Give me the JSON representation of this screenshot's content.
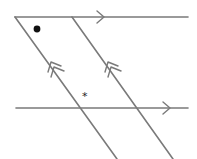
{
  "diagram": {
    "type": "parallel-lines-with-transversals",
    "colors": {
      "line": "#7a7a7a",
      "dot": "#111111",
      "star": "#222222",
      "background": "#ffffff"
    },
    "horizontal_lines": [
      {
        "name": "top-line",
        "x1": 15,
        "y1": 17,
        "x2": 188,
        "y2": 17,
        "arrow": {
          "x": 104,
          "y": 17,
          "count": 1
        }
      },
      {
        "name": "bottom-line",
        "x1": 16,
        "y1": 108,
        "x2": 188,
        "y2": 108,
        "arrow": {
          "x": 170,
          "y": 108,
          "count": 1
        }
      }
    ],
    "transversals": [
      {
        "name": "left-transversal",
        "x1": 15,
        "y1": 17,
        "x2": 117,
        "y2": 159,
        "arrow": {
          "x": 55,
          "y": 68,
          "count": 2
        }
      },
      {
        "name": "right-transversal",
        "x1": 72,
        "y1": 17,
        "x2": 173,
        "y2": 159,
        "arrow": {
          "x": 112,
          "y": 68,
          "count": 2
        }
      }
    ],
    "angle_markers": [
      {
        "name": "dot-marker",
        "symbol": "dot",
        "x": 37,
        "y": 29
      },
      {
        "name": "star-marker",
        "symbol": "*",
        "x": 86,
        "y": 97
      }
    ]
  }
}
